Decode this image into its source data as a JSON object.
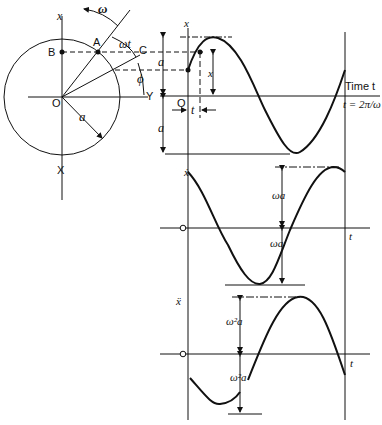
{
  "diagram": {
    "circle": {
      "labels": {
        "x_top": "x",
        "x_bottom": "X",
        "y_axis": "Y",
        "origin": "O",
        "point_a": "A",
        "point_b": "B",
        "point_c": "C",
        "omega": "ω",
        "omega_t": "ωt",
        "phi": "ϕ",
        "radius": "a"
      }
    },
    "displacement_graph": {
      "y_label": "x",
      "origin": "O",
      "amp_top": "a",
      "amp_bottom": "a",
      "x_marker": "x",
      "t_marker": "t",
      "time_label": "Time t",
      "period_label": "t = 2π/ω"
    },
    "velocity_graph": {
      "y_label": "ẋ",
      "t_label": "t",
      "amp_top": "ωa",
      "amp_bottom": "ωa"
    },
    "acceleration_graph": {
      "y_label": "ẍ",
      "t_label": "t",
      "amp_top": "ω²a",
      "amp_bottom": "ω²a"
    },
    "colors": {
      "ink": "#111111",
      "background": "#ffffff"
    }
  }
}
